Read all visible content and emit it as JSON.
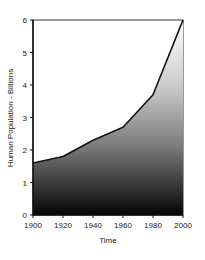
{
  "chart_data": {
    "type": "area",
    "title": "",
    "xlabel": "Time",
    "ylabel": "Human Population - Billions",
    "x": [
      1900,
      1920,
      1940,
      1960,
      1980,
      2000
    ],
    "series": [
      {
        "name": "Human Population",
        "values": [
          1.6,
          1.8,
          2.3,
          2.7,
          3.7,
          6.0
        ]
      }
    ],
    "xlim": [
      1900,
      2000
    ],
    "ylim": [
      0,
      6
    ],
    "xticks": [
      "1900",
      "1920",
      "1940",
      "1960",
      "1980",
      "2000"
    ],
    "yticks": [
      "0",
      "1",
      "2",
      "3",
      "4",
      "5",
      "6"
    ],
    "grid": false,
    "legend": "none",
    "fill": "vertical gradient, black at bottom to white at top",
    "line_color": "#111111"
  }
}
